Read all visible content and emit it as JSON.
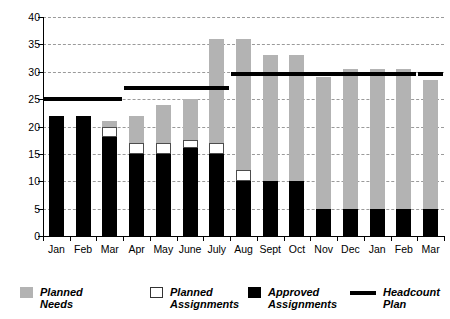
{
  "chart_data": {
    "type": "bar",
    "title": "",
    "subtitle": "",
    "xlabel": "",
    "ylabel": "FTEs",
    "ylim": [
      0,
      40
    ],
    "yticks": [
      0,
      5,
      10,
      15,
      20,
      25,
      30,
      35,
      40
    ],
    "grid": true,
    "stacked": true,
    "legend_position": "bottom",
    "categories": [
      "Jan",
      "Feb",
      "Mar",
      "Apr",
      "May",
      "June",
      "July",
      "Aug",
      "Sept",
      "Oct",
      "Nov",
      "Dec",
      "Jan",
      "Feb",
      "Mar"
    ],
    "series": [
      {
        "name": "Approved Assignments",
        "color": "#000000",
        "values": [
          22,
          22,
          18,
          15,
          15,
          16,
          15,
          10,
          10,
          10,
          5,
          5,
          5,
          5,
          5
        ]
      },
      {
        "name": "Planned Assignments",
        "color": "#ffffff",
        "cumulative_top": [
          22,
          22,
          20,
          17,
          17,
          17.5,
          17,
          12,
          10,
          10,
          5,
          5,
          5,
          5,
          5
        ],
        "values": [
          0,
          0,
          2,
          2,
          2,
          1.5,
          2,
          2,
          0,
          0,
          0,
          0,
          0,
          0,
          0
        ]
      },
      {
        "name": "Planned Needs",
        "color": "#b3b3b3",
        "cumulative_top": [
          22,
          22,
          21,
          22,
          24,
          25,
          36,
          36,
          33,
          33,
          29,
          30.5,
          30.5,
          30.5,
          28.5
        ],
        "values": [
          0,
          0,
          1,
          5,
          7,
          7.5,
          19,
          24,
          23,
          23,
          24,
          25.5,
          25.5,
          25.5,
          23.5
        ]
      }
    ],
    "reference_line": {
      "name": "Headcount Plan",
      "color": "#000000",
      "segments": [
        {
          "value": 25,
          "from_category": "Jan",
          "to_category": "Mar"
        },
        {
          "value": 27,
          "from_category": "Apr",
          "to_category": "July"
        },
        {
          "value": 29.5,
          "from_category": "Aug",
          "to_category": "Feb"
        },
        {
          "value": 29.5,
          "from_category": "Mar",
          "to_category": "Mar"
        }
      ]
    },
    "legend": [
      {
        "label": "Planned Needs",
        "swatch": "gray"
      },
      {
        "label": "Planned Assignments",
        "swatch": "white"
      },
      {
        "label": "Approved Assignments",
        "swatch": "black"
      },
      {
        "label": "Headcount Plan",
        "swatch": "line"
      }
    ]
  },
  "axis": {
    "y_title": "FTEs",
    "y_tick_labels": [
      "40",
      "35",
      "30",
      "25",
      "20",
      "15",
      "10",
      "5",
      "0"
    ],
    "x_tick_labels": [
      "Jan",
      "Feb",
      "Mar",
      "Apr",
      "May",
      "June",
      "July",
      "Aug",
      "Sept",
      "Oct",
      "Nov",
      "Dec",
      "Jan",
      "Feb",
      "Mar"
    ]
  },
  "legend": {
    "items": [
      {
        "label": "Planned Needs"
      },
      {
        "label": "Planned Assignments"
      },
      {
        "label": "Approved Assignments"
      },
      {
        "label": "Headcount Plan"
      }
    ]
  },
  "colors": {
    "planned_needs": "#b3b3b3",
    "planned_assignments": "#ffffff",
    "approved_assignments": "#000000",
    "headcount_plan": "#000000",
    "gridline": "#9a9a9a",
    "background": "#ffffff"
  }
}
